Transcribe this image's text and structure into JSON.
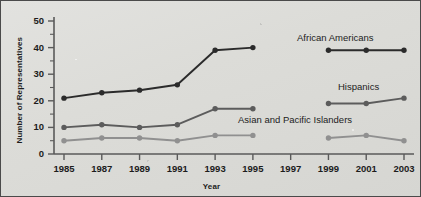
{
  "chart_data": {
    "type": "line",
    "title": "",
    "xlabel": "Year",
    "ylabel": "Number of Representatives",
    "categories": [
      "1985",
      "1987",
      "1989",
      "1991",
      "1993",
      "1995",
      "1997",
      "1999",
      "2001",
      "2003"
    ],
    "x": [
      1985,
      1987,
      1989,
      1991,
      1993,
      1995,
      1997,
      1999,
      2001,
      2003
    ],
    "xlim": [
      1984,
      2004
    ],
    "ylim": [
      0,
      50
    ],
    "yticks": [
      0,
      10,
      20,
      30,
      40,
      50
    ],
    "yminorticks": [
      5,
      15,
      25,
      35,
      45
    ],
    "grid": false,
    "legend_position": "inline-right",
    "series": [
      {
        "name": "African Americans",
        "color": "#2b2b2b",
        "values": [
          21,
          23,
          24,
          26,
          39,
          40,
          null,
          39,
          39,
          39
        ]
      },
      {
        "name": "Hispanics",
        "color": "#5c5c5c",
        "values": [
          10,
          11,
          10,
          11,
          17,
          17,
          null,
          19,
          19,
          21
        ]
      },
      {
        "name": "Asian and Pacific Islanders",
        "color": "#909090",
        "values": [
          5,
          6,
          6,
          5,
          7,
          7,
          null,
          6,
          7,
          5
        ]
      }
    ]
  },
  "axes": {
    "y_tick_labels": [
      "0",
      "10",
      "20",
      "30",
      "40",
      "50"
    ],
    "x_tick_labels": [
      "1985",
      "1987",
      "1989",
      "1991",
      "1993",
      "1995",
      "1997",
      "1999",
      "2001",
      "2003"
    ],
    "x_axis_title": "Year",
    "y_axis_title": "Number of Representatives"
  },
  "series_labels": [
    {
      "text": "African Americans",
      "name": "african-americans"
    },
    {
      "text": "Hispanics",
      "name": "hispanics"
    },
    {
      "text": "Asian and Pacific Islanders",
      "name": "asian-and-pacific-islanders"
    }
  ],
  "colors": {
    "axis": "#5a5a5a",
    "text": "#1c1c1c",
    "background": "#dcdcd8",
    "border": "#4a4a4a",
    "series_1": "#2b2b2b",
    "series_2": "#5c5c5c",
    "series_3": "#909090"
  }
}
